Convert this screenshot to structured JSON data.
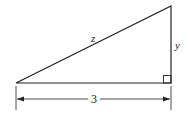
{
  "diagram": {
    "type": "right-triangle",
    "labels": {
      "hypotenuse": "z",
      "vertical_leg": "y",
      "horizontal_leg": "3"
    },
    "stroke_color": "#222222"
  }
}
